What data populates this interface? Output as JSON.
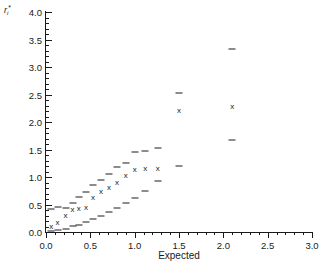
{
  "chart_data": {
    "type": "scatter",
    "title": "",
    "xlabel": "Expected",
    "ylabel": "r_i*",
    "ylabel_base": "r",
    "ylabel_sub": "i",
    "ylabel_sup": "*",
    "xlim": [
      0.0,
      3.0
    ],
    "ylim": [
      0.0,
      4.0
    ],
    "xticks": [
      0.0,
      0.5,
      1.0,
      1.5,
      2.0,
      2.5,
      3.0
    ],
    "xticklabels": [
      "0.0",
      "0.5",
      "1.0",
      "1.5",
      "2.0",
      "2.5",
      "3.0"
    ],
    "yticks": [
      0.0,
      0.5,
      1.0,
      1.5,
      2.0,
      2.5,
      3.0,
      3.5,
      4.0
    ],
    "yticklabels": [
      "0.0",
      "0.5",
      "1.0",
      "1.5",
      "2.0",
      "2.5",
      "3.0",
      "3.5",
      "4.0"
    ],
    "x_minor_step": 0.1,
    "y_minor_step": 0.1,
    "grid": false,
    "legend": null,
    "marker_symbol": "x",
    "errorbar_style": "dash-caps",
    "series": [
      {
        "name": "observed vs expected",
        "points": [
          {
            "x": 0.06,
            "y": 0.1,
            "lo": 0.02,
            "hi": 0.42
          },
          {
            "x": 0.13,
            "y": 0.16,
            "lo": 0.03,
            "hi": 0.45
          },
          {
            "x": 0.22,
            "y": 0.29,
            "lo": 0.06,
            "hi": 0.44
          },
          {
            "x": 0.3,
            "y": 0.4,
            "lo": 0.11,
            "hi": 0.53
          },
          {
            "x": 0.37,
            "y": 0.42,
            "lo": 0.12,
            "hi": 0.63
          },
          {
            "x": 0.45,
            "y": 0.44,
            "lo": 0.19,
            "hi": 0.72
          },
          {
            "x": 0.53,
            "y": 0.62,
            "lo": 0.24,
            "hi": 0.86
          },
          {
            "x": 0.62,
            "y": 0.72,
            "lo": 0.3,
            "hi": 0.94
          },
          {
            "x": 0.71,
            "y": 0.8,
            "lo": 0.37,
            "hi": 1.06
          },
          {
            "x": 0.8,
            "y": 0.9,
            "lo": 0.44,
            "hi": 1.19
          },
          {
            "x": 0.9,
            "y": 1.02,
            "lo": 0.52,
            "hi": 1.26
          },
          {
            "x": 1.0,
            "y": 1.12,
            "lo": 0.62,
            "hi": 1.45
          },
          {
            "x": 1.12,
            "y": 1.14,
            "lo": 0.75,
            "hi": 1.47
          },
          {
            "x": 1.26,
            "y": 1.14,
            "lo": 0.92,
            "hi": 1.52
          },
          {
            "x": 1.5,
            "y": 2.2,
            "lo": 1.2,
            "hi": 2.52
          },
          {
            "x": 2.1,
            "y": 2.28,
            "lo": 1.68,
            "hi": 3.32
          }
        ]
      }
    ]
  }
}
